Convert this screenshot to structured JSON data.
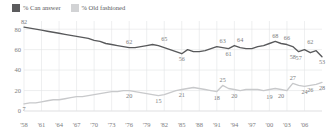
{
  "legend": {
    "position": "top-left",
    "items": [
      {
        "label": "% Can answer",
        "color": "#58595b",
        "swatch": "dark"
      },
      {
        "label": "% Old fashioned",
        "color": "#d2d3d5",
        "swatch": "light"
      }
    ]
  },
  "axes": {
    "yticks": [
      "0",
      "20",
      "40",
      "60",
      "80"
    ],
    "xticks": [
      "'58",
      "'61",
      "'64",
      "'67",
      "'70",
      "'73",
      "'76",
      "'79",
      "'82",
      "'85",
      "'88",
      "'91",
      "'94",
      "'97",
      "'00",
      "'03",
      "'06"
    ]
  },
  "chart_data": {
    "type": "line",
    "title": "",
    "subtitle": "",
    "xlabel": "",
    "ylabel": "",
    "ylim": [
      0,
      88
    ],
    "xlim": [
      1958,
      2009
    ],
    "grid": true,
    "legend_position": "top-left",
    "x": [
      1958,
      1959,
      1960,
      1961,
      1962,
      1963,
      1964,
      1965,
      1966,
      1967,
      1968,
      1969,
      1970,
      1971,
      1972,
      1973,
      1974,
      1975,
      1976,
      1977,
      1978,
      1979,
      1980,
      1981,
      1982,
      1983,
      1984,
      1985,
      1986,
      1987,
      1988,
      1989,
      1990,
      1991,
      1992,
      1993,
      1994,
      1995,
      1996,
      1997,
      1998,
      1999,
      2000,
      2001,
      2002,
      2003,
      2004,
      2005,
      2006,
      2007,
      2008,
      2009
    ],
    "series": [
      {
        "name": "% Can answer",
        "color": "#58595b",
        "values": [
          82,
          81,
          80,
          79,
          78,
          77,
          76,
          75,
          74,
          73,
          72,
          71,
          69,
          68,
          66,
          65,
          64,
          63,
          62,
          62,
          63,
          64,
          65,
          64,
          62,
          60,
          58,
          56,
          60,
          58,
          58,
          59,
          61,
          63,
          62,
          61,
          64,
          62,
          61,
          61,
          63,
          64,
          66,
          68,
          66,
          65,
          63,
          58,
          60,
          57,
          59,
          53
        ],
        "point_labels": [
          {
            "x": 1958,
            "value": 82,
            "position": "above"
          },
          {
            "x": 1976,
            "value": 62,
            "position": "above"
          },
          {
            "x": 1982,
            "value": 65,
            "position": "above"
          },
          {
            "x": 1985,
            "value": 56,
            "position": "below"
          },
          {
            "x": 1992,
            "value": 63,
            "position": "above"
          },
          {
            "x": 1993,
            "value": 61,
            "position": "below"
          },
          {
            "x": 1995,
            "value": 64,
            "position": "above"
          },
          {
            "x": 2001,
            "value": 68,
            "position": "above"
          },
          {
            "x": 2003,
            "value": 66,
            "position": "above"
          },
          {
            "x": 2004,
            "value": 58,
            "position": "below"
          },
          {
            "x": 2005,
            "value": 57,
            "position": "below"
          },
          {
            "x": 2007,
            "value": 62,
            "position": "above"
          },
          {
            "x": 2009,
            "value": 53,
            "position": "below"
          }
        ]
      },
      {
        "name": "% Old fashioned",
        "color": "#c8c9cb",
        "values": [
          7,
          8,
          8,
          9,
          10,
          11,
          11,
          12,
          13,
          14,
          14,
          15,
          16,
          17,
          18,
          19,
          19,
          20,
          20,
          19,
          18,
          17,
          16,
          15,
          16,
          18,
          20,
          21,
          22,
          23,
          22,
          21,
          20,
          19,
          25,
          22,
          21,
          20,
          21,
          21,
          21,
          20,
          21,
          22,
          21,
          20,
          27,
          25,
          24,
          25,
          26,
          28
        ],
        "point_labels": [
          {
            "x": 1958,
            "value": 7,
            "position": "below"
          },
          {
            "x": 1976,
            "value": 20,
            "position": "below"
          },
          {
            "x": 1981,
            "value": 15,
            "position": "below"
          },
          {
            "x": 1985,
            "value": 21,
            "position": "below"
          },
          {
            "x": 1992,
            "value": 25,
            "position": "above"
          },
          {
            "x": 1991,
            "value": 18,
            "position": "below"
          },
          {
            "x": 1994,
            "value": 20,
            "position": "below"
          },
          {
            "x": 2000,
            "value": 19,
            "position": "below"
          },
          {
            "x": 2002,
            "value": 20,
            "position": "below"
          },
          {
            "x": 2004,
            "value": 27,
            "position": "above"
          },
          {
            "x": 2006,
            "value": 24,
            "position": "below"
          },
          {
            "x": 2007,
            "value": 26,
            "position": "below"
          },
          {
            "x": 2009,
            "value": 28,
            "position": "below"
          }
        ]
      }
    ]
  }
}
